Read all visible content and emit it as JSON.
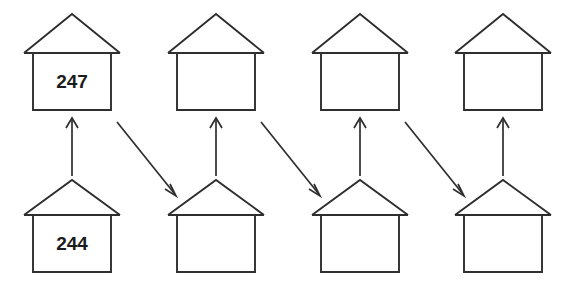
{
  "diagram": {
    "background_color": "#ffffff",
    "stroke_color": "#2e2e2e",
    "label_color": "#1c1c1c",
    "rows": [
      {
        "name": "top-row",
        "houses": [
          {
            "id": "top-house-1",
            "label": "247"
          },
          {
            "id": "top-house-2",
            "label": ""
          },
          {
            "id": "top-house-3",
            "label": ""
          },
          {
            "id": "top-house-4",
            "label": ""
          }
        ]
      },
      {
        "name": "bottom-row",
        "houses": [
          {
            "id": "bottom-house-1",
            "label": "244"
          },
          {
            "id": "bottom-house-2",
            "label": ""
          },
          {
            "id": "bottom-house-3",
            "label": ""
          },
          {
            "id": "bottom-house-4",
            "label": ""
          }
        ]
      }
    ],
    "arrows": [
      {
        "id": "arrow-up-1",
        "kind": "vertical-up",
        "from": "bottom-house-1",
        "to": "top-house-1"
      },
      {
        "id": "arrow-diagonal-1",
        "kind": "diagonal-down-right",
        "from": "top-house-1",
        "to": "bottom-house-2"
      },
      {
        "id": "arrow-up-2",
        "kind": "vertical-up",
        "from": "bottom-house-2",
        "to": "top-house-2"
      },
      {
        "id": "arrow-diagonal-2",
        "kind": "diagonal-down-right",
        "from": "top-house-2",
        "to": "bottom-house-3"
      },
      {
        "id": "arrow-up-3",
        "kind": "vertical-up",
        "from": "bottom-house-3",
        "to": "top-house-3"
      },
      {
        "id": "arrow-diagonal-3",
        "kind": "diagonal-down-right",
        "from": "top-house-3",
        "to": "bottom-house-4"
      },
      {
        "id": "arrow-up-4",
        "kind": "vertical-up",
        "from": "bottom-house-4",
        "to": "top-house-4"
      }
    ]
  }
}
